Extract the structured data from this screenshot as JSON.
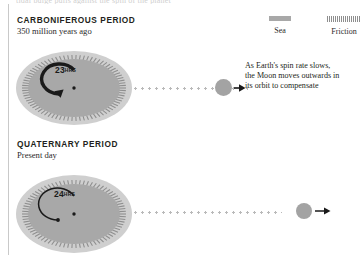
{
  "meta": {
    "top_cropped_text": "tidal bulge pulls against the spin of the planet"
  },
  "legend": {
    "items": [
      {
        "label": "Sea",
        "swatch": "solid-bar-swatch",
        "color": "#a8a8a8"
      },
      {
        "label": "Friction",
        "swatch": "hatched-bar-swatch",
        "color": "#8e8e8e"
      }
    ]
  },
  "sections": [
    {
      "id": "carboniferous",
      "title": "CARBONIFEROUS PERIOD",
      "subtitle": "350 million years ago",
      "earth": {
        "day_length_value": "23",
        "day_length_unit": "HRS",
        "spin_speed": "fast",
        "sea_color": "#cfcfcf",
        "land_color": "#a8a8a8",
        "friction_color": "#8e8e8e"
      },
      "moon": {
        "color": "#a3a3a3",
        "distance_label": "near"
      },
      "annotation": "As Earth's spin rate slows, the Moon moves outwards in its orbit to compensate"
    },
    {
      "id": "quaternary",
      "title": "QUATERNARY PERIOD",
      "subtitle": "Present day",
      "earth": {
        "day_length_value": "24",
        "day_length_unit": "HRS",
        "spin_speed": "slow",
        "sea_color": "#cfcfcf",
        "land_color": "#a8a8a8",
        "friction_color": "#8e8e8e"
      },
      "moon": {
        "color": "#a3a3a3",
        "distance_label": "far"
      },
      "annotation": ""
    }
  ],
  "colors": {
    "background": "#ffffff",
    "text": "#231f20",
    "rule": "#c9c9c9",
    "orbit_dot": "#b9b9b9",
    "arrow": "#1a1a1a"
  }
}
